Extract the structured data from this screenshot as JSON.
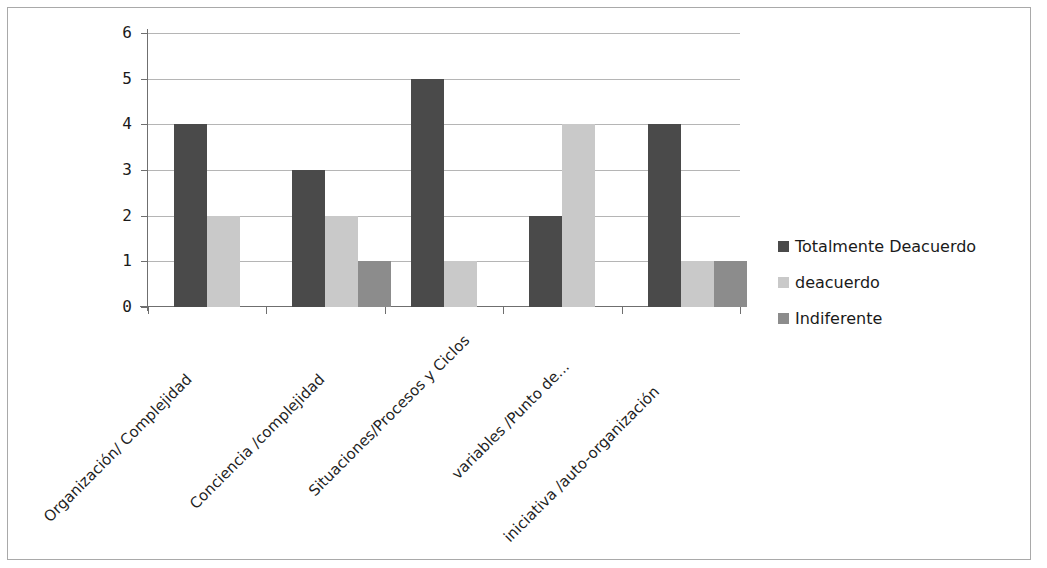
{
  "chart_data": {
    "type": "bar",
    "title": "",
    "xlabel": "",
    "ylabel": "",
    "ylim": [
      0,
      6
    ],
    "yticks": [
      "0",
      "1",
      "2",
      "3",
      "4",
      "5",
      "6"
    ],
    "grid": true,
    "legend_position": "right",
    "categories": [
      "Organización/ Complejidad",
      "Conciencia /complejidad",
      "Situaciones/Procesos y Ciclos",
      "variables /Punto de...",
      "iniciativa /auto-organización"
    ],
    "series": [
      {
        "name": "Totalmente Deacuerdo",
        "color": "#4a4a4a",
        "values": [
          4,
          3,
          5,
          2,
          4
        ]
      },
      {
        "name": "deacuerdo",
        "color": "#c9c9c9",
        "values": [
          2,
          2,
          1,
          4,
          1
        ]
      },
      {
        "name": "Indiferente",
        "color": "#8c8c8c",
        "values": [
          0,
          1,
          0,
          0,
          1
        ]
      }
    ]
  },
  "legend": {
    "items": [
      {
        "label": "Totalmente Deacuerdo",
        "color": "#4a4a4a"
      },
      {
        "label": "deacuerdo",
        "color": "#c9c9c9"
      },
      {
        "label": "Indiferente",
        "color": "#8c8c8c"
      }
    ]
  },
  "axis": {
    "y_tick_labels": [
      "6",
      "5",
      "4",
      "3",
      "2",
      "1",
      "0"
    ]
  }
}
